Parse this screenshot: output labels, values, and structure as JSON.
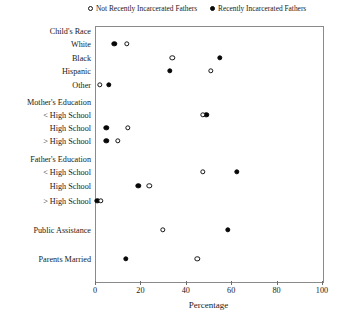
{
  "chart_data": {
    "type": "scatter",
    "title": "",
    "xlabel": "Percentage",
    "ylabel": "",
    "xlim": [
      0,
      100
    ],
    "xticks": [
      0,
      20,
      40,
      60,
      80,
      100
    ],
    "grid": false,
    "legend_position": "top",
    "legend": [
      {
        "name": "Not Recently Incarcerated Fathers",
        "marker": "open-circle"
      },
      {
        "name": "Recently Incarcerated Fathers",
        "marker": "filled-circle"
      }
    ],
    "categories": [
      "Child's Race",
      "White",
      "Black",
      "Hispanic",
      "Other",
      "Mother's Education",
      "< High School",
      "High School",
      "> High School",
      "Father's Education",
      "< High School",
      "High School",
      "> High School",
      "Public Assistance",
      "Parents Married"
    ],
    "category_is_header": [
      true,
      false,
      false,
      false,
      false,
      true,
      false,
      false,
      false,
      true,
      false,
      false,
      false,
      false,
      false
    ],
    "series": [
      {
        "name": "Not Recently Incarcerated Fathers",
        "marker": "open-circle",
        "values": [
          null,
          14.0,
          34.0,
          51.0,
          2.0,
          null,
          47.5,
          14.5,
          10.0,
          null,
          47.5,
          24.0,
          2.5,
          30.0,
          45.0
        ]
      },
      {
        "name": "Recently Incarcerated Fathers",
        "marker": "filled-circle",
        "values": [
          null,
          8.5,
          55.0,
          33.0,
          6.0,
          null,
          49.0,
          5.0,
          5.0,
          null,
          62.5,
          19.0,
          1.0,
          58.5,
          13.5
        ]
      }
    ]
  },
  "axis": {
    "tick_labels": [
      "0",
      "20",
      "40",
      "60",
      "80",
      "100"
    ],
    "x_title": "Percentage"
  },
  "legend": {
    "open_label": "Not Recently Incarcerated Fathers",
    "solid_label": "Recently Incarcerated Fathers"
  },
  "colors": {
    "marker_fill": "#070707",
    "marker_stroke": "#151515",
    "frame": "#8a8a8a",
    "background": "#ffffff"
  }
}
